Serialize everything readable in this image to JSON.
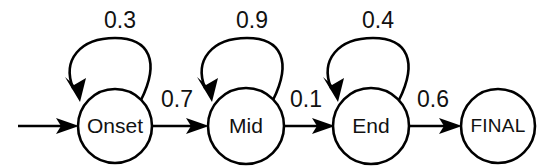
{
  "diagram": {
    "type": "state-transition-diagram",
    "title": "",
    "background_color": "#ffffff",
    "stroke_color": "#000000",
    "text_color": "#111111",
    "states": [
      {
        "id": "onset",
        "label": "Onset",
        "cx": 115,
        "cy": 126,
        "r": 37
      },
      {
        "id": "mid",
        "label": "Mid",
        "cx": 246,
        "cy": 126,
        "r": 38
      },
      {
        "id": "end",
        "label": "End",
        "cx": 371,
        "cy": 126,
        "r": 38
      },
      {
        "id": "final",
        "label": "FINAL",
        "cx": 498,
        "cy": 126,
        "r": 37
      }
    ],
    "start_arrow": {
      "name": "start-transition",
      "from_x": 18,
      "to_x": 78,
      "y": 126,
      "label": ""
    },
    "self_loops": [
      {
        "id": "loop-onset",
        "state": "onset",
        "label": "0.3",
        "label_x": 120,
        "label_y": 22
      },
      {
        "id": "loop-mid",
        "state": "mid",
        "label": "0.9",
        "label_x": 252,
        "label_y": 22
      },
      {
        "id": "loop-end",
        "state": "end",
        "label": "0.4",
        "label_x": 378,
        "label_y": 22
      }
    ],
    "transitions": [
      {
        "id": "onset-to-mid",
        "from": "onset",
        "to": "mid",
        "label": "0.7",
        "label_x": 177,
        "label_y": 101
      },
      {
        "id": "mid-to-end",
        "from": "mid",
        "to": "end",
        "label": "0.1",
        "label_x": 306,
        "label_y": 101
      },
      {
        "id": "end-to-final",
        "from": "end",
        "to": "final",
        "label": "0.6",
        "label_x": 433,
        "label_y": 101
      }
    ]
  }
}
